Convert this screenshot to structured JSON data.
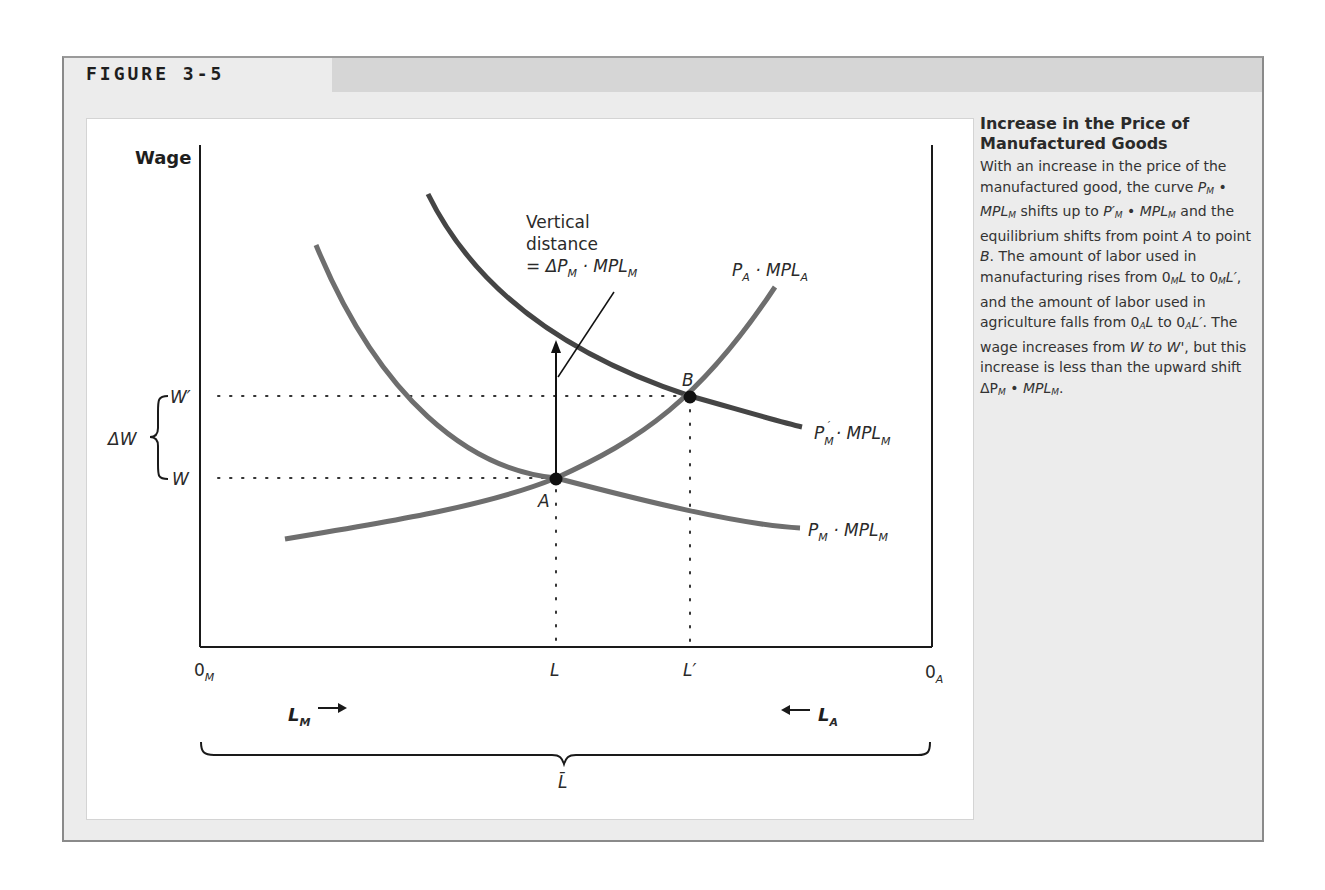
{
  "figure": {
    "label": "FIGURE 3-5"
  },
  "caption": {
    "title": "Increase in the Price of Manufactured Goods",
    "body_segments": [
      "With an increase in the price of the manufactured good, the curve ",
      "P_M • MPL_M",
      " shifts up to ",
      "P'_M • MPL_M",
      " and the equilibrium shifts from point ",
      "A",
      " to point ",
      "B",
      ". The amount of labor used in manufacturing rises from 0_M L to 0_M L', and the amount of labor used in agriculture falls from 0_A L to 0_A L'. The wage increases from ",
      "W to W'",
      ", but this increase is less than the upward shift ",
      "ΔP_M • MPL_M",
      "."
    ],
    "body_text": "With an increase in the price of the manufactured good, the curve P_M • MPL_M shifts up to P'_M • MPL_M and the equilibrium shifts from point A to point B. The amount of labor used in manufacturing rises from 0_M L to 0_M L', and the amount of labor used in agriculture falls from 0_A L to 0_A L'. The wage increases from W to W', but this increase is less than the upward shift ΔP_M • MPL_M."
  },
  "diagram": {
    "y_axis_label": "Wage",
    "origin_left": {
      "main": "0",
      "sub": "M"
    },
    "origin_right": {
      "main": "0",
      "sub": "A"
    },
    "wage_levels": {
      "w_prime": "W′",
      "w": "W",
      "delta_w": "ΔW"
    },
    "x_marks": {
      "l": "L",
      "l_prime": "L′"
    },
    "points": {
      "a": "A",
      "b": "B"
    },
    "annotation": {
      "line1": "Vertical",
      "line2": "distance",
      "line3_prefix": "= ΔP",
      "line3_sub": "M",
      "line3_mid": " · MPL",
      "line3_sub2": "M"
    },
    "curves": {
      "pa_mpla": {
        "p": "P",
        "p_sub": "A",
        "mid": " · MPL",
        "sub": "A"
      },
      "pm_prime_mplm": {
        "p": "P",
        "p_sub": "M",
        "prime": "′",
        "mid": " · MPL",
        "sub": "M"
      },
      "pm_mplm": {
        "p": "P",
        "p_sub": "M",
        "mid": " · MPL",
        "sub": "M"
      }
    },
    "labor_arrows": {
      "lm": {
        "main": "L",
        "sub": "M",
        "arrow": "→"
      },
      "la": {
        "main": "L",
        "sub": "A",
        "arrow": "←"
      }
    },
    "total_labor": "L̄",
    "colors": {
      "axis": "#1a1a1a",
      "curve_initial": "#6e6e6e",
      "curve_shifted": "#454545",
      "point": "#111111",
      "dotted": "#333333"
    }
  }
}
